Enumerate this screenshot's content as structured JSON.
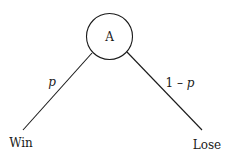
{
  "diagram": {
    "type": "probability-tree",
    "root": {
      "label": "A"
    },
    "branches": [
      {
        "probability": "p",
        "outcome": "Win"
      },
      {
        "probability": "1 – p",
        "outcome": "Lose"
      }
    ],
    "colors": {
      "stroke": "#1a1a1a",
      "background": "#ffffff"
    }
  }
}
